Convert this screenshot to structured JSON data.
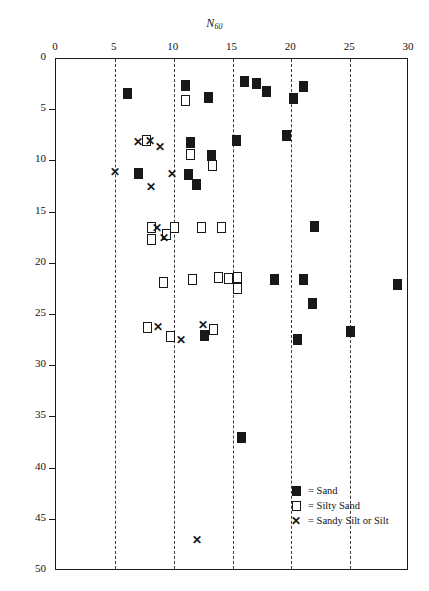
{
  "chart_data": {
    "type": "scatter",
    "title": "N60",
    "xlabel": "N60",
    "ylabel": "Depth (ft)",
    "xlim": [
      0,
      30
    ],
    "ylim": [
      0,
      50
    ],
    "y_inverted": true,
    "xticks": [
      0,
      5,
      10,
      15,
      20,
      25,
      30
    ],
    "yticks": [
      0,
      5,
      10,
      15,
      20,
      25,
      30,
      35,
      40,
      45,
      50
    ],
    "grid": "vertical-dashed",
    "legend_position": "bottom-right",
    "series": [
      {
        "name": "Sand",
        "marker": "filled-square",
        "color": "#17181a",
        "points": [
          [
            6.1,
            3.4
          ],
          [
            11.0,
            2.6
          ],
          [
            13.0,
            3.8
          ],
          [
            16.0,
            2.2
          ],
          [
            17.0,
            2.4
          ],
          [
            17.9,
            3.2
          ],
          [
            20.2,
            3.9
          ],
          [
            21.0,
            2.7
          ],
          [
            11.4,
            8.2
          ],
          [
            13.2,
            9.4
          ],
          [
            15.3,
            8.0
          ],
          [
            19.6,
            7.5
          ],
          [
            7.0,
            11.2
          ],
          [
            11.3,
            11.3
          ],
          [
            11.9,
            12.3
          ],
          [
            22.0,
            16.4
          ],
          [
            12.6,
            27.0
          ],
          [
            18.6,
            21.5
          ],
          [
            21.0,
            21.5
          ],
          [
            21.8,
            23.9
          ],
          [
            20.5,
            27.4
          ],
          [
            25.0,
            26.6
          ],
          [
            29.0,
            22.0
          ],
          [
            15.8,
            37.0
          ]
        ]
      },
      {
        "name": "Silty Sand",
        "marker": "open-square",
        "color": "#17181a",
        "points": [
          [
            11.0,
            4.1
          ],
          [
            7.7,
            8.0
          ],
          [
            11.4,
            9.3
          ],
          [
            13.3,
            10.4
          ],
          [
            9.4,
            17.1
          ],
          [
            8.1,
            16.5
          ],
          [
            8.1,
            17.6
          ],
          [
            10.1,
            16.5
          ],
          [
            12.4,
            16.5
          ],
          [
            14.1,
            16.5
          ],
          [
            9.1,
            21.8
          ],
          [
            11.6,
            21.5
          ],
          [
            13.8,
            21.3
          ],
          [
            14.7,
            21.4
          ],
          [
            15.4,
            21.3
          ],
          [
            15.4,
            22.4
          ],
          [
            7.8,
            26.2
          ],
          [
            9.7,
            27.1
          ],
          [
            13.4,
            26.4
          ]
        ]
      },
      {
        "name": "Sandy Silt or Silt",
        "marker": "x",
        "color": "#17181a",
        "points": [
          [
            7.0,
            8.1
          ],
          [
            8.0,
            8.0
          ],
          [
            8.8,
            8.6
          ],
          [
            5.0,
            11.0
          ],
          [
            8.1,
            12.5
          ],
          [
            9.9,
            11.2
          ],
          [
            8.6,
            16.5
          ],
          [
            9.2,
            17.5
          ],
          [
            8.7,
            26.2
          ],
          [
            10.6,
            27.4
          ],
          [
            12.5,
            26.0
          ],
          [
            12.0,
            47.0
          ]
        ]
      }
    ]
  },
  "axis": {
    "x_title_main": "N",
    "x_title_sub": "60",
    "y_title": "Depth (ft)",
    "xticks": [
      "0",
      "5",
      "10",
      "15",
      "20",
      "25",
      "30"
    ],
    "yticks": [
      "0",
      "5",
      "10",
      "15",
      "20",
      "25",
      "30",
      "35",
      "40",
      "45",
      "50"
    ]
  },
  "legend": {
    "items": [
      {
        "symbol": "filled-square",
        "label": "= Sand"
      },
      {
        "symbol": "open-square",
        "label": "= Silty Sand"
      },
      {
        "symbol": "x-mark",
        "label": "= Sandy Silt or Silt"
      }
    ]
  }
}
